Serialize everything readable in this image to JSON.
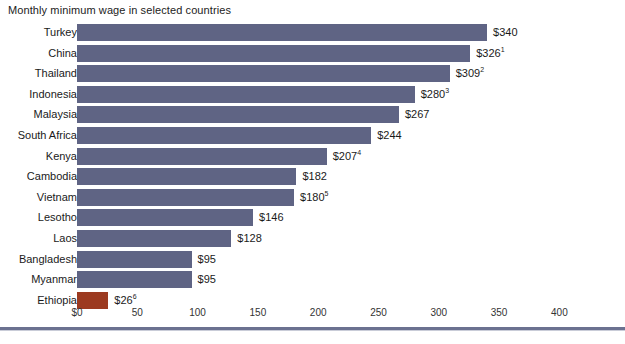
{
  "chart_data": {
    "type": "bar",
    "orientation": "horizontal",
    "title": "Monthly minimum wage in selected countries",
    "xlabel": "",
    "ylabel": "",
    "xlim": [
      0,
      448
    ],
    "grid": false,
    "legend": "none",
    "axis_ticks": [
      {
        "value": 0,
        "label": "$0"
      },
      {
        "value": 50,
        "label": "50"
      },
      {
        "value": 100,
        "label": "100"
      },
      {
        "value": 150,
        "label": "150"
      },
      {
        "value": 200,
        "label": "200"
      },
      {
        "value": 250,
        "label": "250"
      },
      {
        "value": 300,
        "label": "300"
      },
      {
        "value": 350,
        "label": "350"
      },
      {
        "value": 400,
        "label": "400"
      }
    ],
    "categories": [
      "Turkey",
      "China",
      "Thailand",
      "Indonesia",
      "Malaysia",
      "South Africa",
      "Kenya",
      "Cambodia",
      "Vietnam",
      "Lesotho",
      "Laos",
      "Bangladesh",
      "Myanmar",
      "Ethiopia"
    ],
    "values": [
      340,
      326,
      309,
      280,
      267,
      244,
      207,
      182,
      180,
      146,
      128,
      95,
      95,
      26
    ],
    "bars": [
      {
        "label": "Turkey",
        "value": 340,
        "value_label": "$340",
        "footnote": "",
        "color": "#5f6484"
      },
      {
        "label": "China",
        "value": 326,
        "value_label": "$326",
        "footnote": "1",
        "color": "#5f6484"
      },
      {
        "label": "Thailand",
        "value": 309,
        "value_label": "$309",
        "footnote": "2",
        "color": "#5f6484"
      },
      {
        "label": "Indonesia",
        "value": 280,
        "value_label": "$280",
        "footnote": "3",
        "color": "#5f6484"
      },
      {
        "label": "Malaysia",
        "value": 267,
        "value_label": "$267",
        "footnote": "",
        "color": "#5f6484"
      },
      {
        "label": "South Africa",
        "value": 244,
        "value_label": "$244",
        "footnote": "",
        "color": "#5f6484"
      },
      {
        "label": "Kenya",
        "value": 207,
        "value_label": "$207",
        "footnote": "4",
        "color": "#5f6484"
      },
      {
        "label": "Cambodia",
        "value": 182,
        "value_label": "$182",
        "footnote": "",
        "color": "#5f6484"
      },
      {
        "label": "Vietnam",
        "value": 180,
        "value_label": "$180",
        "footnote": "5",
        "color": "#5f6484"
      },
      {
        "label": "Lesotho",
        "value": 146,
        "value_label": "$146",
        "footnote": "",
        "color": "#5f6484"
      },
      {
        "label": "Laos",
        "value": 128,
        "value_label": "$128",
        "footnote": "",
        "color": "#5f6484"
      },
      {
        "label": "Bangladesh",
        "value": 95,
        "value_label": "$95",
        "footnote": "",
        "color": "#5f6484"
      },
      {
        "label": "Myanmar",
        "value": 95,
        "value_label": "$95",
        "footnote": "",
        "color": "#5f6484"
      },
      {
        "label": "Ethiopia",
        "value": 26,
        "value_label": "$26",
        "footnote": "6",
        "color": "#9c3a20"
      }
    ],
    "colors": {
      "bar_default": "#5f6484",
      "bar_highlight": "#9c3a20",
      "axis_rule": "#6b7190",
      "text": "#1a1a1a",
      "background": "#ffffff"
    }
  }
}
